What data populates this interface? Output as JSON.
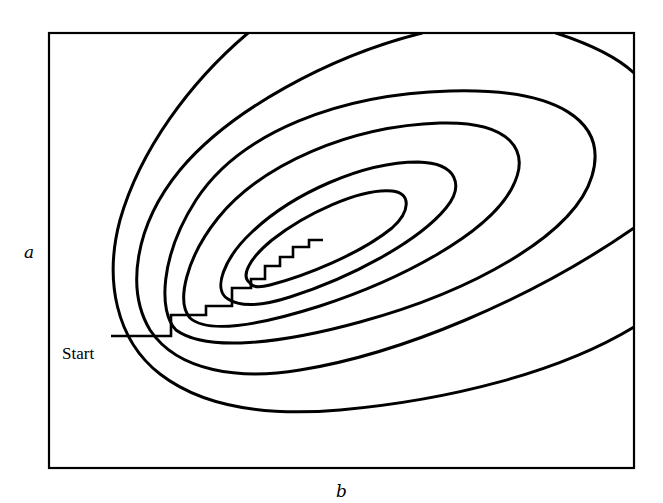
{
  "figure": {
    "x_axis_label": "b",
    "y_axis_label": "a",
    "start_label": "Start",
    "stroke_color": "#000000",
    "background_color": "#ffffff"
  },
  "frame": {
    "x": 49,
    "y": 33,
    "width": 585,
    "height": 435
  },
  "contours": [
    {
      "id": 1,
      "name": "innermost-contour",
      "closed": true,
      "d": "M 250 283 C 240 276, 250 258, 272 240 C 305 214, 360 188, 392 191 C 412 193, 410 212, 392 228 C 360 254, 305 276, 270 285 C 258 288, 252 287, 250 283 Z"
    },
    {
      "id": 2,
      "name": "contour-2",
      "closed": true,
      "d": "M 228 299 C 212 290, 224 258, 252 232 C 292 194, 362 162, 418 162 C 458 163, 464 186, 446 208 C 418 242, 350 278, 290 297 C 262 306, 240 307, 228 299 Z"
    },
    {
      "id": 3,
      "name": "contour-3",
      "closed": true,
      "d": "M 190 318 C 176 302, 186 258, 218 218 C 262 164, 350 126, 440 123 C 510 121, 532 150, 512 188 C 488 234, 400 280, 320 306 C 260 325, 208 334, 190 318 Z"
    },
    {
      "id": 4,
      "name": "contour-4",
      "closed": true,
      "d": "M 176 330 C 158 312, 160 256, 196 200 C 240 132, 340 94, 450 91 C 560 88, 608 122, 592 176 C 574 236, 470 292, 360 322 C 280 344, 206 352, 176 330 Z"
    },
    {
      "id": 5,
      "name": "contour-5",
      "closed": false,
      "d": "M 422 33 C 330 56, 230 110, 180 170 C 134 226, 126 290, 150 330 C 178 372, 240 380, 300 370 C 400 354, 530 300, 634 228"
    },
    {
      "id": 6,
      "name": "contour-6",
      "closed": false,
      "d": "M 248 33 C 190 82, 140 150, 120 220 C 104 280, 116 340, 160 374 C 204 408, 270 416, 340 410 C 450 400, 560 372, 634 327"
    },
    {
      "id": 7,
      "name": "corner-contour",
      "closed": false,
      "d": "M 556 33 C 590 44, 618 58, 634 73"
    }
  ],
  "descent_path": {
    "name": "coordinate-descent-path",
    "points": [
      [
        111,
        336
      ],
      [
        171,
        336
      ],
      [
        171,
        315
      ],
      [
        206,
        315
      ],
      [
        206,
        306
      ],
      [
        232,
        306
      ],
      [
        232,
        288
      ],
      [
        251,
        288
      ],
      [
        251,
        279
      ],
      [
        265,
        279
      ],
      [
        265,
        266
      ],
      [
        280,
        266
      ],
      [
        280,
        257
      ],
      [
        293,
        257
      ],
      [
        293,
        247
      ],
      [
        309,
        247
      ],
      [
        309,
        240
      ],
      [
        323,
        240
      ]
    ]
  },
  "labels": {
    "a": {
      "x": 24,
      "y": 258
    },
    "b": {
      "x": 336,
      "y": 497
    },
    "start": {
      "x": 62,
      "y": 359
    }
  }
}
